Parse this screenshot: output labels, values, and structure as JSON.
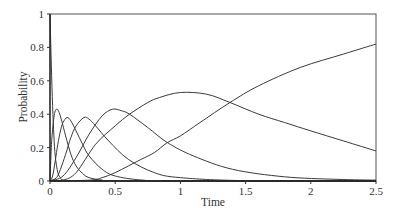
{
  "chart_data": {
    "type": "line",
    "title": "",
    "xlabel": "Time",
    "ylabel": "Probability",
    "xlim": [
      0,
      2.5
    ],
    "ylim": [
      0,
      1
    ],
    "xticks": [
      0,
      0.5,
      1,
      1.5,
      2,
      2.5
    ],
    "xtick_labels": [
      "0",
      "0.5",
      "1",
      "1.5",
      "2",
      "2.5"
    ],
    "yticks": [
      0,
      0.2,
      0.4,
      0.6,
      0.8,
      1
    ],
    "ytick_labels": [
      "0",
      "0.2",
      "0.4",
      "0.6",
      "0.8",
      "1"
    ],
    "grid": false,
    "legend": null,
    "series": [
      {
        "name": "state 0",
        "x": [
          0,
          0.01,
          0.02,
          0.03,
          0.04,
          0.06,
          0.08,
          0.1,
          0.2,
          2.5
        ],
        "values": [
          1.0,
          0.7,
          0.45,
          0.27,
          0.15,
          0.05,
          0.02,
          0.005,
          0.0,
          0.0
        ]
      },
      {
        "name": "state 1",
        "x": [
          0,
          0.01,
          0.02,
          0.03,
          0.04,
          0.055,
          0.07,
          0.09,
          0.12,
          0.16,
          0.2,
          0.25,
          0.3,
          0.4,
          0.5,
          2.5
        ],
        "values": [
          0,
          0.2,
          0.31,
          0.38,
          0.42,
          0.43,
          0.41,
          0.36,
          0.27,
          0.16,
          0.09,
          0.045,
          0.02,
          0.005,
          0.0,
          0.0
        ]
      },
      {
        "name": "state 2",
        "x": [
          0,
          0.02,
          0.04,
          0.06,
          0.08,
          0.1,
          0.13,
          0.16,
          0.2,
          0.25,
          0.3,
          0.4,
          0.5,
          0.7,
          1.0,
          2.5
        ],
        "values": [
          0,
          0.03,
          0.12,
          0.22,
          0.3,
          0.35,
          0.38,
          0.36,
          0.3,
          0.22,
          0.15,
          0.07,
          0.03,
          0.006,
          0.0,
          0.0
        ]
      },
      {
        "name": "state 3",
        "x": [
          0,
          0.05,
          0.08,
          0.12,
          0.16,
          0.2,
          0.26,
          0.3,
          0.35,
          0.45,
          0.6,
          0.8,
          1.0,
          1.5,
          2.5
        ],
        "values": [
          0,
          0.02,
          0.07,
          0.16,
          0.26,
          0.33,
          0.38,
          0.37,
          0.33,
          0.24,
          0.13,
          0.05,
          0.02,
          0.002,
          0.0
        ]
      },
      {
        "name": "state 4",
        "x": [
          0,
          0.1,
          0.2,
          0.3,
          0.4,
          0.48,
          0.55,
          0.61,
          0.75,
          0.9,
          1.1,
          1.4,
          1.8,
          2.2,
          2.5
        ],
        "values": [
          0,
          0.03,
          0.14,
          0.28,
          0.39,
          0.43,
          0.42,
          0.4,
          0.32,
          0.23,
          0.15,
          0.07,
          0.025,
          0.01,
          0.005
        ]
      },
      {
        "name": "state 5",
        "x": [
          0,
          0.1,
          0.2,
          0.35,
          0.5,
          0.61,
          0.75,
          0.84,
          1.0,
          1.2,
          1.38,
          1.6,
          1.8,
          2.0,
          2.25,
          2.5
        ],
        "values": [
          0,
          0.005,
          0.05,
          0.22,
          0.33,
          0.4,
          0.47,
          0.5,
          0.53,
          0.52,
          0.47,
          0.4,
          0.35,
          0.3,
          0.24,
          0.18
        ]
      },
      {
        "name": "absorbing state",
        "x": [
          0,
          0.3,
          0.4,
          0.5,
          0.6,
          0.7,
          0.8,
          0.9,
          1.0,
          1.15,
          1.38,
          1.6,
          1.92,
          2.25,
          2.5
        ],
        "values": [
          0,
          0.005,
          0.02,
          0.05,
          0.09,
          0.13,
          0.17,
          0.23,
          0.27,
          0.35,
          0.47,
          0.57,
          0.68,
          0.76,
          0.82
        ]
      }
    ]
  },
  "plot_area": {
    "left": 50,
    "right": 376,
    "top": 14,
    "bottom": 181
  }
}
